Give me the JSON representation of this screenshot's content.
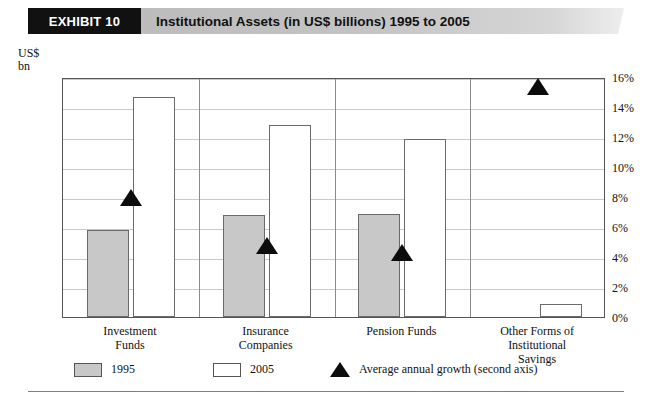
{
  "header": {
    "tag": "EXHIBIT 10",
    "title": "Institutional Assets (in US$ billions) 1995 to 2005"
  },
  "axis_unit_line1": "US$",
  "axis_unit_line2": "bn",
  "legend": {
    "items": [
      {
        "label": "1995",
        "icon": "gray-square-swatch"
      },
      {
        "label": "2005",
        "icon": "white-square-swatch"
      },
      {
        "label": "Average annual growth (second axis)",
        "icon": "black-triangle-marker"
      }
    ]
  },
  "chart_data": {
    "type": "bar",
    "title": "Institutional Assets (in US$ billions) 1995 to 2005",
    "xlabel": "",
    "ylabel": "US$ bn",
    "y2label": "",
    "ylim": [
      0,
      16000
    ],
    "y2lim": [
      0,
      16
    ],
    "grid": true,
    "legend_position": "bottom",
    "categories": [
      "Investment Funds",
      "Insurance Companies",
      "Pension Funds",
      "Other Forms of Institutional Savings"
    ],
    "category_lines": [
      [
        "Investment",
        "Funds"
      ],
      [
        "Insurance",
        "Companies"
      ],
      [
        "Pension Funds"
      ],
      [
        "Other Forms of",
        "Institutional",
        "Savings"
      ]
    ],
    "series": [
      {
        "name": "1995",
        "axis": "left",
        "values": [
          5800,
          6800,
          6900,
          0
        ]
      },
      {
        "name": "2005",
        "axis": "left",
        "values": [
          14700,
          12800,
          11900,
          870
        ]
      },
      {
        "name": "Average annual growth (second axis)",
        "axis": "right",
        "type": "scatter-triangle",
        "values": [
          8.1,
          4.9,
          4.4,
          15.5
        ]
      }
    ],
    "yticks": [
      0,
      2000,
      4000,
      6000,
      8000,
      10000,
      12000,
      14000,
      16000
    ],
    "ytick_labels": [
      "0",
      "2,000",
      "4,000",
      "6,000",
      "8,000",
      "10,000",
      "12,000",
      "14,000",
      "16,000"
    ],
    "y2ticks": [
      0,
      2,
      4,
      6,
      8,
      10,
      12,
      14,
      16
    ],
    "y2tick_labels": [
      "0%",
      "2%",
      "4%",
      "6%",
      "8%",
      "10%",
      "12%",
      "14%",
      "16%"
    ]
  }
}
